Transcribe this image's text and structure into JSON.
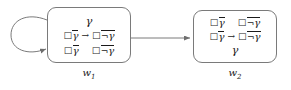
{
  "diagram": {
    "type": "kripke-model-two-worlds",
    "background_color": "#ffffff",
    "line_color": "#7a7a7a",
    "text_color": "#1a1a1a",
    "symbols": {
      "box_modal": "□",
      "negation": "¬",
      "implication_arrow": "→",
      "gamma": "γ"
    },
    "worlds": [
      {
        "id": "w1",
        "label_base": "w",
        "label_sub": "1",
        "lines": [
          {
            "kind": "gamma-only",
            "text": "γ"
          },
          {
            "kind": "implication",
            "left": {
              "box": "□",
              "neg": "",
              "gamma": "γ",
              "overbar": true
            },
            "arrow": "→",
            "right": {
              "box": "□",
              "neg": "¬",
              "gamma": "γ",
              "overbar": true
            }
          },
          {
            "kind": "pair",
            "left": {
              "box": "□",
              "neg": "",
              "gamma": "γ",
              "overbar": true
            },
            "right": {
              "box": "□",
              "neg": "¬",
              "gamma": "γ",
              "overbar": true
            }
          }
        ]
      },
      {
        "id": "w2",
        "label_base": "w",
        "label_sub": "2",
        "lines": [
          {
            "kind": "pair",
            "left": {
              "box": "□",
              "neg": "",
              "gamma": "γ",
              "overbar": true
            },
            "right": {
              "box": "□",
              "neg": "¬",
              "gamma": "γ",
              "overbar": true
            }
          },
          {
            "kind": "implication",
            "left": {
              "box": "□",
              "neg": "",
              "gamma": "γ",
              "overbar": true
            },
            "arrow": "→",
            "right": {
              "box": "□",
              "neg": "¬",
              "gamma": "γ",
              "overbar": true
            }
          },
          {
            "kind": "gamma-only",
            "text": "γ"
          }
        ]
      }
    ],
    "edges": [
      {
        "id": "self-loop-w1",
        "from": "w1",
        "to": "w1",
        "style": "reflexive-loop-left"
      },
      {
        "id": "edge-w1-w2",
        "from": "w1",
        "to": "w2",
        "style": "straight-horizontal"
      }
    ]
  }
}
